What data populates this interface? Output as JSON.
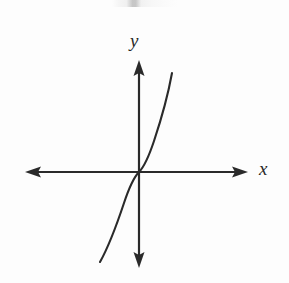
{
  "figure": {
    "name": "cubic-function-graph",
    "background_color": "#fdfdfd",
    "ink_color": "#2a2a2a",
    "width": 289,
    "height": 283,
    "artifact_note": ""
  },
  "labels": {
    "y_axis": "y",
    "x_axis": "x"
  },
  "chart_data": {
    "type": "line",
    "title": "",
    "subtitle": "",
    "xlabel": "x",
    "ylabel": "y",
    "grid": false,
    "legend": [],
    "legend_position": "none",
    "annotations": [],
    "tick_labels": {
      "x": [],
      "y": []
    },
    "axes": {
      "origin_px": [
        139,
        172
      ],
      "x_axis_px": {
        "y": 172,
        "x_start": 25,
        "x_end": 248,
        "arrows": [
          "left",
          "right"
        ]
      },
      "y_axis_px": {
        "x": 139,
        "y_start": 60,
        "y_end": 268,
        "arrows": [
          "up",
          "down"
        ]
      },
      "xlim": [
        -2.2,
        2.2
      ],
      "ylim": [
        -2.2,
        2.2
      ]
    },
    "series": [
      {
        "name": "y = x^3",
        "equation": "y = x^3",
        "color": "#2a2a2a",
        "x": [
          -1.55,
          -1.4,
          -1.25,
          -1.1,
          -0.95,
          -0.8,
          -0.65,
          -0.5,
          -0.35,
          -0.2,
          0.0,
          0.2,
          0.35,
          0.5,
          0.65,
          0.8,
          0.95,
          1.1,
          1.25,
          1.4,
          1.5
        ],
        "y": [
          -3.724,
          -2.744,
          -1.953,
          -1.331,
          -0.857,
          -0.512,
          -0.275,
          -0.125,
          -0.043,
          -0.008,
          0.0,
          0.008,
          0.043,
          0.125,
          0.275,
          0.512,
          0.857,
          1.331,
          1.953,
          2.744,
          3.375
        ],
        "path_px": "M 100 262 C 109 246 117 224 124 203 C 129 188 133 178 139 172 C 145 166 149 156 154 141 C 161 120 168 95 172 73"
      }
    ]
  }
}
